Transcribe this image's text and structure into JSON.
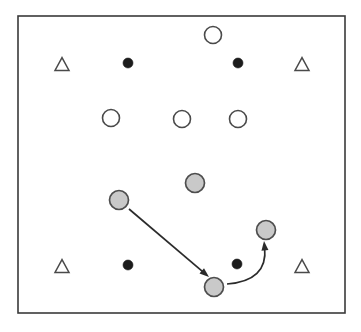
{
  "canvas": {
    "width": 361,
    "height": 332,
    "background": "#ffffff"
  },
  "frame": {
    "name": "field-boundary",
    "x": 18,
    "y": 16,
    "width": 327,
    "height": 297,
    "stroke": "#3a3a3a",
    "fill": "#ffffff",
    "stroke_width": 1.6
  },
  "legend_colors": {
    "open_circle_fill": "#ffffff",
    "filled_dot_fill": "#1c1c1c",
    "gray_circle_fill": "#c9c9c9",
    "gray_circle_stroke": "#4e4e4e",
    "outline_stroke": "#4a4a4a",
    "edge_stroke": "#2b2b2b"
  },
  "chart_data": {
    "type": "scatter",
    "title": "",
    "xlabel": "",
    "ylabel": "",
    "xlim": [
      18,
      345
    ],
    "ylim": [
      16,
      313
    ],
    "grid": false,
    "legend_position": "none",
    "series": [
      {
        "name": "open-circle",
        "marker": "circle-open",
        "fill": "#ffffff",
        "stroke": "#4a4a4a",
        "radius": 8.5,
        "points": [
          {
            "id": "open-circle-top",
            "x": 213,
            "y": 35
          },
          {
            "id": "open-circle-mid-left",
            "x": 111,
            "y": 118
          },
          {
            "id": "open-circle-mid-center",
            "x": 182,
            "y": 119
          },
          {
            "id": "open-circle-mid-right",
            "x": 238,
            "y": 119
          }
        ]
      },
      {
        "name": "filled-dot",
        "marker": "circle-filled",
        "fill": "#1c1c1c",
        "radius": 5,
        "points": [
          {
            "id": "dot-top-left",
            "x": 128,
            "y": 63
          },
          {
            "id": "dot-top-right",
            "x": 238,
            "y": 63
          },
          {
            "id": "dot-bottom-left",
            "x": 128,
            "y": 265
          },
          {
            "id": "dot-bottom-right",
            "x": 237,
            "y": 264
          }
        ]
      },
      {
        "name": "gray-circle",
        "marker": "circle-gray",
        "fill": "#c9c9c9",
        "stroke": "#4e4e4e",
        "radius": 9.5,
        "points": [
          {
            "id": "gray-circle-center",
            "x": 195,
            "y": 183
          },
          {
            "id": "gray-circle-left",
            "x": 119,
            "y": 200
          },
          {
            "id": "gray-circle-right",
            "x": 266,
            "y": 230
          },
          {
            "id": "gray-circle-bottom",
            "x": 214,
            "y": 287
          }
        ]
      },
      {
        "name": "triangle",
        "marker": "triangle-open",
        "fill": "#ffffff",
        "stroke": "#4a4a4a",
        "size": 14,
        "points": [
          {
            "id": "triangle-top-left",
            "x": 62,
            "y": 64
          },
          {
            "id": "triangle-top-right",
            "x": 302,
            "y": 64
          },
          {
            "id": "triangle-bottom-left",
            "x": 62,
            "y": 266
          },
          {
            "id": "triangle-bottom-right",
            "x": 302,
            "y": 266
          }
        ]
      }
    ],
    "annotations": [
      {
        "id": "straight-arrow",
        "type": "arrow-straight",
        "from": {
          "x": 129,
          "y": 209
        },
        "to": {
          "x": 209,
          "y": 277
        },
        "stroke": "#2b2b2b",
        "stroke_width": 1.7,
        "arrowhead": "solid-triangle"
      },
      {
        "id": "curved-arrow",
        "type": "arrow-curved",
        "from": {
          "x": 227,
          "y": 284
        },
        "control": {
          "x": 268,
          "y": 281
        },
        "to": {
          "x": 264,
          "y": 241
        },
        "stroke": "#2b2b2b",
        "stroke_width": 1.7,
        "arrowhead": "solid-triangle"
      }
    ]
  }
}
